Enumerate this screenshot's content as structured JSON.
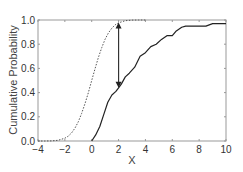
{
  "chart_data": {
    "type": "line",
    "title": "",
    "xlabel": "X",
    "ylabel": "Cumulative Probability",
    "xlim": [
      -4,
      10
    ],
    "ylim": [
      0.0,
      1.0
    ],
    "xticks": [
      -4,
      -2,
      0,
      2,
      4,
      6,
      8,
      10
    ],
    "xtick_labels": [
      "−4",
      "−2",
      "0",
      "2",
      "4",
      "6",
      "8",
      "10"
    ],
    "yticks": [
      0.0,
      0.2,
      0.4,
      0.6,
      0.8,
      1.0
    ],
    "ytick_labels": [
      "0.0",
      "0.2",
      "0.4",
      "0.6",
      "0.8",
      "1.0"
    ],
    "grid": false,
    "legend": null,
    "series": [
      {
        "name": "reference CDF (dashed)",
        "style": "dashed",
        "color": "#555555",
        "x": [
          -4,
          -3.5,
          -3,
          -2.5,
          -2,
          -1.75,
          -1.5,
          -1.25,
          -1,
          -0.75,
          -0.5,
          -0.25,
          0,
          0.25,
          0.5,
          0.75,
          1,
          1.25,
          1.5,
          1.75,
          2,
          2.5,
          3,
          3.5,
          4
        ],
        "values": [
          0.0,
          0.0,
          0.001,
          0.006,
          0.023,
          0.04,
          0.067,
          0.106,
          0.159,
          0.227,
          0.309,
          0.401,
          0.5,
          0.599,
          0.691,
          0.773,
          0.841,
          0.894,
          0.933,
          0.96,
          0.977,
          0.994,
          0.999,
          1.0,
          1.0
        ]
      },
      {
        "name": "empirical CDF (solid)",
        "style": "solid",
        "color": "#222222",
        "x": [
          0,
          0.3,
          0.6,
          0.9,
          1.2,
          1.5,
          1.8,
          2.0,
          2.2,
          2.5,
          2.8,
          3.2,
          3.6,
          4.0,
          4.4,
          4.8,
          5.2,
          5.6,
          6.0,
          6.3,
          6.7,
          7.0,
          8.0,
          8.5,
          9.0,
          10.0
        ],
        "values": [
          0.0,
          0.05,
          0.12,
          0.22,
          0.32,
          0.38,
          0.41,
          0.44,
          0.47,
          0.53,
          0.56,
          0.61,
          0.7,
          0.73,
          0.78,
          0.8,
          0.84,
          0.87,
          0.87,
          0.91,
          0.94,
          0.95,
          0.95,
          0.95,
          0.97,
          0.97
        ]
      }
    ],
    "annotations": [
      {
        "type": "double-arrow",
        "x": 2,
        "y_from": 0.44,
        "y_to": 0.98,
        "description": "vertical distance between the two CDFs at X=2"
      }
    ]
  },
  "axes": {
    "x_label": "X",
    "y_label": "Cumulative Probability"
  }
}
